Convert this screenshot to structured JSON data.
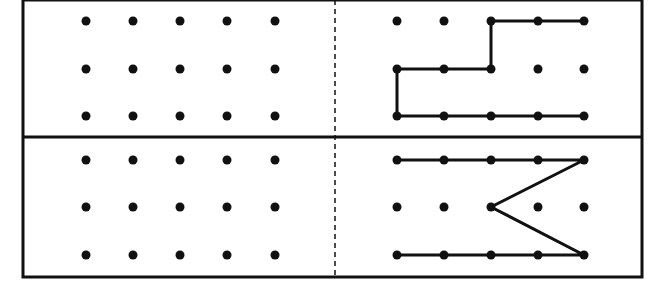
{
  "diagram": {
    "title": "",
    "colors": {
      "line": "#111111",
      "dot": "#111111",
      "background": "#ffffff"
    },
    "frame": {
      "left": 23,
      "top": 0,
      "right": 642,
      "bottom": 277,
      "mid_y": 137,
      "divider_x": 335
    },
    "grid": {
      "cols": 5,
      "rows": 3,
      "left_x": [
        86,
        133,
        180,
        227,
        275
      ],
      "right_x": [
        397,
        444,
        491,
        538,
        584
      ],
      "top_y": [
        21,
        69,
        116
      ],
      "bottom_y": [
        160,
        207,
        255
      ],
      "dot_radius": 4.5
    },
    "panels": [
      {
        "id": "top-left",
        "side": "left",
        "row": "top",
        "paths": []
      },
      {
        "id": "top-right",
        "side": "right",
        "row": "top",
        "paths": [
          [
            [
              2,
              0
            ],
            [
              3,
              0
            ],
            [
              4,
              0
            ]
          ],
          [
            [
              2,
              0
            ],
            [
              2,
              1
            ],
            [
              1,
              1
            ],
            [
              0,
              1
            ],
            [
              0,
              2
            ],
            [
              1,
              2
            ],
            [
              2,
              2
            ],
            [
              3,
              2
            ],
            [
              4,
              2
            ]
          ]
        ]
      },
      {
        "id": "bottom-left",
        "side": "left",
        "row": "bottom",
        "paths": []
      },
      {
        "id": "bottom-right",
        "side": "right",
        "row": "bottom",
        "paths": [
          [
            [
              0,
              0
            ],
            [
              1,
              0
            ],
            [
              2,
              0
            ],
            [
              3,
              0
            ],
            [
              4,
              0
            ],
            [
              2,
              1
            ],
            [
              4,
              2
            ],
            [
              3,
              2
            ],
            [
              2,
              2
            ],
            [
              1,
              2
            ],
            [
              0,
              2
            ]
          ]
        ]
      }
    ]
  }
}
